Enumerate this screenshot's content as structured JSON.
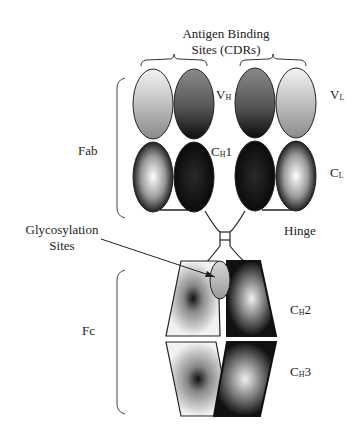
{
  "diagram": {
    "labels": {
      "antigen_binding_line1": "Antigen Binding",
      "antigen_binding_line2": "Sites (CDRs)",
      "vh_main": "V",
      "vh_sub": "H",
      "vl_main": "V",
      "vl_sub": "L",
      "ch1_main": "C",
      "ch1_sub": "H",
      "ch1_tail": "1",
      "cl_main": "C",
      "cl_sub": "L",
      "fab": "Fab",
      "glyco_line1": "Glycosylation",
      "glyco_line2": "Sites",
      "hinge": "Hinge",
      "fc": "Fc",
      "ch2_main": "C",
      "ch2_sub": "H",
      "ch2_tail": "2",
      "ch3_main": "C",
      "ch3_sub": "H",
      "ch3_tail": "3"
    },
    "colors": {
      "stroke": "#222222",
      "light": "#eeeeee",
      "dark": "#1a1a1a",
      "mid": "#777777"
    }
  }
}
